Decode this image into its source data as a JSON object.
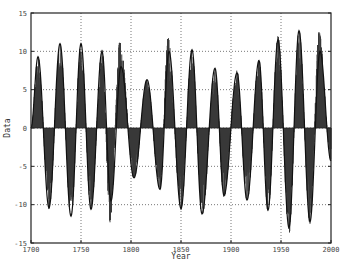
{
  "chart_data": {
    "type": "line",
    "title": "",
    "xlabel": "Year",
    "ylabel": "Data",
    "xlim": [
      1700,
      2000
    ],
    "ylim": [
      -15,
      15
    ],
    "grid": true,
    "legend": null,
    "x_ticks": [
      1700,
      1750,
      1800,
      1850,
      1900,
      1950,
      2000
    ],
    "y_ticks": [
      -15,
      -10,
      -5,
      0,
      5,
      10,
      15
    ],
    "x_tick_labels": [
      "1700",
      "1750",
      "1800",
      "1850",
      "1900",
      "1950",
      "2000"
    ],
    "y_tick_labels": [
      "-15",
      "-10",
      "-5",
      "0",
      "5",
      "10",
      "15"
    ],
    "series": [
      {
        "name": "data",
        "style": "filled stems from zero (dark gray)",
        "extrema": [
          {
            "x": 1700,
            "y": 0
          },
          {
            "x": 1707,
            "y": 9.3
          },
          {
            "x": 1718,
            "y": -10.6
          },
          {
            "x": 1729,
            "y": 11.2
          },
          {
            "x": 1740,
            "y": -11.7
          },
          {
            "x": 1750,
            "y": 11.2
          },
          {
            "x": 1760,
            "y": -10.8
          },
          {
            "x": 1771,
            "y": 10.2
          },
          {
            "x": 1779,
            "y": -12.3
          },
          {
            "x": 1789,
            "y": 11.4
          },
          {
            "x": 1803,
            "y": -6.5
          },
          {
            "x": 1816,
            "y": 6.3
          },
          {
            "x": 1829,
            "y": -8.0
          },
          {
            "x": 1837,
            "y": 11.8
          },
          {
            "x": 1850,
            "y": -10.7
          },
          {
            "x": 1861,
            "y": 10.3
          },
          {
            "x": 1871,
            "y": -11.8
          },
          {
            "x": 1884,
            "y": 7.9
          },
          {
            "x": 1893,
            "y": -9.0
          },
          {
            "x": 1906,
            "y": 7.5
          },
          {
            "x": 1916,
            "y": -9.6
          },
          {
            "x": 1928,
            "y": 8.9
          },
          {
            "x": 1937,
            "y": -10.9
          },
          {
            "x": 1947,
            "y": 12.0
          },
          {
            "x": 1958,
            "y": -13.8
          },
          {
            "x": 1968,
            "y": 12.7
          },
          {
            "x": 1979,
            "y": -12.5
          },
          {
            "x": 1988,
            "y": 12.5
          },
          {
            "x": 2000,
            "y": -4.3
          }
        ]
      },
      {
        "name": "fit",
        "style": "smooth black line",
        "extrema": [
          {
            "x": 1700,
            "y": 0
          },
          {
            "x": 1707,
            "y": 9.3
          },
          {
            "x": 1718,
            "y": -10.4
          },
          {
            "x": 1729,
            "y": 11.0
          },
          {
            "x": 1740,
            "y": -11.5
          },
          {
            "x": 1750,
            "y": 11.0
          },
          {
            "x": 1760,
            "y": -10.6
          },
          {
            "x": 1771,
            "y": 10.0
          },
          {
            "x": 1780,
            "y": -9.5
          },
          {
            "x": 1790,
            "y": 8.0
          },
          {
            "x": 1803,
            "y": -6.5
          },
          {
            "x": 1816,
            "y": 6.3
          },
          {
            "x": 1829,
            "y": -8.0
          },
          {
            "x": 1838,
            "y": 10.0
          },
          {
            "x": 1850,
            "y": -10.5
          },
          {
            "x": 1861,
            "y": 10.2
          },
          {
            "x": 1871,
            "y": -11.2
          },
          {
            "x": 1884,
            "y": 7.8
          },
          {
            "x": 1893,
            "y": -8.8
          },
          {
            "x": 1906,
            "y": 7.2
          },
          {
            "x": 1916,
            "y": -9.4
          },
          {
            "x": 1928,
            "y": 8.8
          },
          {
            "x": 1937,
            "y": -10.7
          },
          {
            "x": 1947,
            "y": 11.5
          },
          {
            "x": 1958,
            "y": -13.0
          },
          {
            "x": 1968,
            "y": 12.7
          },
          {
            "x": 1979,
            "y": -12.2
          },
          {
            "x": 1989,
            "y": 10.0
          },
          {
            "x": 2000,
            "y": -4.3
          }
        ]
      }
    ]
  }
}
